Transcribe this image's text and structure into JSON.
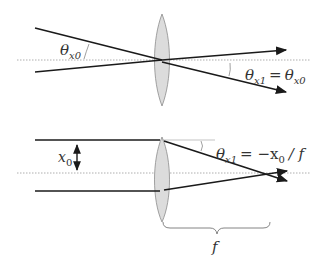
{
  "diagram": {
    "panels": [
      {
        "id": "top",
        "description": "Rays through lens center are undeviated",
        "labels": {
          "theta_in": "θ",
          "theta_in_sub": "x0",
          "theta_out": "θ",
          "theta_out_sub": "x1",
          "equals": "=",
          "theta_out_rhs": "θ",
          "theta_out_rhs_sub": "x0"
        }
      },
      {
        "id": "bottom",
        "description": "Parallel rays offset by x0 focus at distance f",
        "labels": {
          "offset": "x",
          "offset_sub": "0",
          "theta_out": "θ",
          "theta_out_sub": "x1",
          "eq_rhs_minus": "= −x",
          "eq_rhs_sub": "0",
          "eq_rhs_tail": "/ f",
          "focal": "f"
        }
      }
    ],
    "colors": {
      "ray": "#1a1a1a",
      "axis": "#9a9a9a",
      "lens_fill": "#dcdcdc",
      "lens_stroke": "#8c8c8c",
      "angle_arc": "#888888",
      "brace": "#777777"
    }
  }
}
